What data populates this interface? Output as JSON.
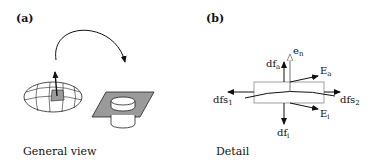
{
  "panels": [
    {
      "tag": "(a)",
      "caption": "General view"
    },
    {
      "tag": "(b)",
      "caption": "Detail",
      "labels": {
        "dfa": "df",
        "dfa_sub": "a",
        "en": "e",
        "en_sub": "n",
        "Ea": "E",
        "Ea_sub": "a",
        "dfs1": "dfs",
        "dfs1_sub": "1",
        "dfs2": "dfs",
        "dfs2_sub": "2",
        "Ei": "E",
        "Ei_sub": "i",
        "dfi": "df",
        "dfi_sub": "i"
      }
    }
  ],
  "colors": {
    "stroke": "#111111",
    "fill_gray": "#9a9a9a",
    "box_stroke": "#888888",
    "en_arrow": "#888888"
  }
}
